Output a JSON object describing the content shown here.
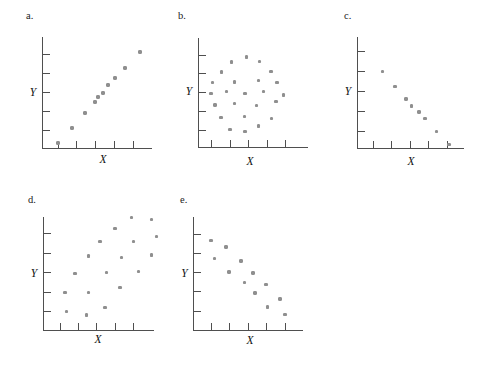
{
  "page": {
    "background": "#ffffff"
  },
  "colors": {
    "dot": "#8f8f8f",
    "axis": "#4f4f4f",
    "text": "#1a1a1a"
  },
  "chart_data": [
    {
      "id": "a",
      "panel_label": "a.",
      "type": "scatter",
      "xlabel": "X",
      "ylabel": "Y",
      "pattern": "strong positive linear correlation",
      "x_ticks": [
        1,
        2,
        3,
        4,
        5
      ],
      "y_ticks": [
        1,
        2,
        3,
        4,
        5
      ],
      "xlim": [
        0,
        6
      ],
      "ylim": [
        0,
        6
      ],
      "grid": false,
      "points": [
        [
          1.0,
          0.35
        ],
        [
          1.75,
          1.13
        ],
        [
          2.43,
          1.92
        ],
        [
          2.96,
          2.49
        ],
        [
          3.12,
          2.75
        ],
        [
          3.38,
          2.96
        ],
        [
          3.65,
          3.38
        ],
        [
          4.02,
          3.75
        ],
        [
          4.54,
          4.27
        ],
        [
          5.34,
          5.11
        ]
      ]
    },
    {
      "id": "b",
      "panel_label": "b.",
      "type": "scatter",
      "xlabel": "X",
      "ylabel": "Y",
      "pattern": "no correlation (circular cloud)",
      "x_ticks": [
        1,
        2,
        3,
        4,
        5
      ],
      "y_ticks": [
        1,
        2,
        3,
        4,
        5
      ],
      "xlim": [
        0,
        6
      ],
      "ylim": [
        0,
        6
      ],
      "grid": false,
      "points": [
        [
          2.89,
          4.89
        ],
        [
          2.08,
          4.63
        ],
        [
          3.59,
          4.65
        ],
        [
          1.54,
          4.09
        ],
        [
          4.22,
          4.12
        ],
        [
          1.05,
          3.53
        ],
        [
          2.24,
          3.56
        ],
        [
          3.54,
          3.64
        ],
        [
          4.54,
          3.53
        ],
        [
          0.97,
          2.95
        ],
        [
          1.81,
          3.05
        ],
        [
          2.81,
          2.95
        ],
        [
          3.81,
          3.05
        ],
        [
          4.89,
          2.87
        ],
        [
          1.19,
          2.33
        ],
        [
          2.24,
          2.41
        ],
        [
          3.43,
          2.31
        ],
        [
          4.49,
          2.52
        ],
        [
          1.51,
          1.67
        ],
        [
          2.78,
          1.72
        ],
        [
          4.24,
          1.61
        ],
        [
          2.0,
          1.03
        ],
        [
          2.81,
          0.92
        ],
        [
          3.54,
          1.21
        ]
      ]
    },
    {
      "id": "c",
      "panel_label": "c.",
      "type": "scatter",
      "xlabel": "X",
      "ylabel": "Y",
      "pattern": "strong negative linear correlation",
      "x_ticks": [
        1,
        2,
        3,
        4,
        5
      ],
      "y_ticks": [
        1,
        2,
        3,
        4,
        5
      ],
      "xlim": [
        0,
        6
      ],
      "ylim": [
        0,
        6
      ],
      "grid": false,
      "points": [
        [
          1.51,
          4.0
        ],
        [
          2.19,
          3.25
        ],
        [
          2.78,
          2.63
        ],
        [
          3.08,
          2.28
        ],
        [
          3.49,
          1.98
        ],
        [
          3.81,
          1.65
        ],
        [
          4.43,
          1.0
        ],
        [
          5.11,
          0.35
        ]
      ]
    },
    {
      "id": "d",
      "panel_label": "d.",
      "type": "scatter",
      "xlabel": "X",
      "ylabel": "Y",
      "pattern": "moderate positive correlation (scattered)",
      "x_ticks": [
        1,
        2,
        3,
        4,
        5
      ],
      "y_ticks": [
        1,
        2,
        3,
        4,
        5
      ],
      "xlim": [
        0,
        6.5
      ],
      "ylim": [
        0,
        6.5
      ],
      "grid": false,
      "points": [
        [
          4.89,
          5.82
        ],
        [
          5.97,
          5.72
        ],
        [
          3.99,
          5.26
        ],
        [
          3.17,
          4.59
        ],
        [
          4.99,
          4.59
        ],
        [
          6.24,
          4.85
        ],
        [
          2.55,
          3.85
        ],
        [
          4.34,
          3.77
        ],
        [
          5.97,
          3.9
        ],
        [
          1.82,
          2.95
        ],
        [
          3.53,
          3.0
        ],
        [
          5.27,
          3.05
        ],
        [
          1.27,
          1.97
        ],
        [
          2.55,
          1.97
        ],
        [
          4.26,
          2.23
        ],
        [
          1.35,
          1.0
        ],
        [
          3.45,
          1.21
        ],
        [
          2.44,
          0.82
        ]
      ]
    },
    {
      "id": "e",
      "panel_label": "e.",
      "type": "scatter",
      "xlabel": "X",
      "ylabel": "Y",
      "pattern": "moderate negative correlation (scattered)",
      "x_ticks": [
        1,
        2,
        3,
        4,
        5
      ],
      "y_ticks": [
        1,
        2,
        3,
        4,
        5
      ],
      "xlim": [
        0,
        6
      ],
      "ylim": [
        0,
        6
      ],
      "grid": false,
      "points": [
        [
          1.0,
          4.69
        ],
        [
          1.8,
          4.35
        ],
        [
          1.19,
          3.75
        ],
        [
          2.63,
          3.62
        ],
        [
          1.97,
          3.04
        ],
        [
          3.27,
          2.99
        ],
        [
          2.8,
          2.49
        ],
        [
          3.98,
          2.39
        ],
        [
          3.38,
          1.94
        ],
        [
          4.73,
          1.63
        ],
        [
          4.04,
          1.21
        ],
        [
          4.98,
          0.82
        ]
      ]
    }
  ]
}
